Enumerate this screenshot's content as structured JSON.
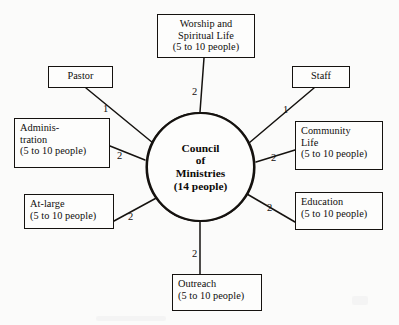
{
  "diagram": {
    "type": "hub-and-spoke organizational chart",
    "background_color": "#fbfbfa",
    "line_color": "#15120f",
    "hub": {
      "name": "council-of-ministries",
      "text": "Council\nof\nMinistries\n(14 people)",
      "title_lines": [
        "Council",
        "of",
        "Ministries"
      ],
      "size_note": "(14 people)",
      "center_x": 200,
      "center_y": 167,
      "radius": 55
    },
    "nodes": [
      {
        "id": "worship",
        "name": "worship-and-spiritual-life",
        "text": "Worship and\nSpiritual Life\n(5 to 10 people)",
        "label_lines": [
          "Worship and",
          "Spiritual Life"
        ],
        "size_note": "(5 to 10 people)",
        "edge_label": "2",
        "x": 157,
        "y": 14,
        "w": 98,
        "h": 44
      },
      {
        "id": "pastor",
        "name": "pastor",
        "text": "Pastor",
        "label_lines": [
          "Pastor"
        ],
        "size_note": "",
        "edge_label": "1",
        "x": 48,
        "y": 66,
        "w": 65,
        "h": 22
      },
      {
        "id": "staff",
        "name": "staff",
        "text": "Staff",
        "label_lines": [
          "Staff"
        ],
        "size_note": "",
        "edge_label": "1",
        "x": 292,
        "y": 66,
        "w": 58,
        "h": 22
      },
      {
        "id": "administration",
        "name": "administration",
        "text": "Adminis-\ntration\n(5 to 10 people)",
        "label_lines": [
          "Adminis-",
          "tration"
        ],
        "size_note": "(5 to 10 people)",
        "edge_label": "2",
        "x": 14,
        "y": 118,
        "w": 96,
        "h": 50
      },
      {
        "id": "community-life",
        "name": "community-life",
        "text": "Community\nLife\n(5 to 10 people)",
        "label_lines": [
          "Community",
          "Life"
        ],
        "size_note": "(5 to 10 people)",
        "edge_label": "2",
        "x": 295,
        "y": 121,
        "w": 88,
        "h": 49
      },
      {
        "id": "at-large",
        "name": "at-large",
        "text": "At-large\n(5 to 10 people)",
        "label_lines": [
          "At-large"
        ],
        "size_note": "(5 to 10 people)",
        "edge_label": "2",
        "x": 24,
        "y": 194,
        "w": 90,
        "h": 35
      },
      {
        "id": "education",
        "name": "education",
        "text": "Education\n(5 to 10 people)",
        "label_lines": [
          "Education"
        ],
        "size_note": "(5 to 10 people)",
        "edge_label": "2",
        "x": 295,
        "y": 192,
        "w": 88,
        "h": 38
      },
      {
        "id": "outreach",
        "name": "outreach",
        "text": "Outreach\n(5 to 10 people)",
        "label_lines": [
          "Outreach"
        ],
        "size_note": "(5 to 10 people)",
        "edge_label": "2",
        "x": 172,
        "y": 274,
        "w": 90,
        "h": 37
      }
    ],
    "edges": [
      {
        "id": "edge-worship",
        "from": "council-of-ministries",
        "to": "worship",
        "label": "2",
        "label_x": 192,
        "label_y": 86
      },
      {
        "id": "edge-pastor",
        "from": "council-of-ministries",
        "to": "pastor",
        "label": "1",
        "label_x": 103,
        "label_y": 108
      },
      {
        "id": "edge-staff",
        "from": "council-of-ministries",
        "to": "staff",
        "label": "1",
        "label_x": 283,
        "label_y": 109
      },
      {
        "id": "edge-admin",
        "from": "council-of-ministries",
        "to": "administration",
        "label": "2",
        "label_x": 117,
        "label_y": 154
      },
      {
        "id": "edge-community",
        "from": "council-of-ministries",
        "to": "community-life",
        "label": "2",
        "label_x": 271,
        "label_y": 154
      },
      {
        "id": "edge-at-large",
        "from": "council-of-ministries",
        "to": "at-large",
        "label": "2",
        "label_x": 128,
        "label_y": 213
      },
      {
        "id": "edge-education",
        "from": "council-of-ministries",
        "to": "education",
        "label": "2",
        "label_x": 267,
        "label_y": 205
      },
      {
        "id": "edge-outreach",
        "from": "council-of-ministries",
        "to": "outreach",
        "label": "2",
        "label_x": 192,
        "label_y": 250
      }
    ]
  }
}
